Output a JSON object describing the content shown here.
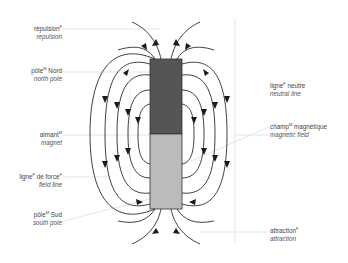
{
  "diagram": {
    "colors": {
      "north_pole": "#555555",
      "south_pole": "#bbbbbb",
      "field_line": "#2a2a2a",
      "leader_line": "#d4d4d4",
      "text": "#444444"
    },
    "magnet": {
      "north_label": "N",
      "south_label": "S"
    }
  },
  "labels": {
    "repulsion": {
      "fr": "répulsion",
      "gender": "F",
      "en": "repulsion"
    },
    "north_pole": {
      "fr": "pôle",
      "gender": "M",
      "fr_suffix": " Nord",
      "en": "north pole"
    },
    "magnet": {
      "fr": "aimant",
      "gender": "M",
      "en": "magnet"
    },
    "field_line": {
      "fr": "ligne",
      "gender": "F",
      "fr_suffix": " de force",
      "gender2": "F",
      "en": "field line"
    },
    "south_pole": {
      "fr": "pôle",
      "gender": "M",
      "fr_suffix": " Sud",
      "en": "south pole"
    },
    "neutral_line": {
      "fr": "ligne",
      "gender": "F",
      "fr_suffix": " neutre",
      "en": "neutral line"
    },
    "magnetic_field": {
      "fr": "champ",
      "gender": "M",
      "fr_suffix": " magnétique",
      "en": "magnetic field"
    },
    "attraction": {
      "fr": "attraction",
      "gender": "F",
      "en": "attraction"
    }
  }
}
